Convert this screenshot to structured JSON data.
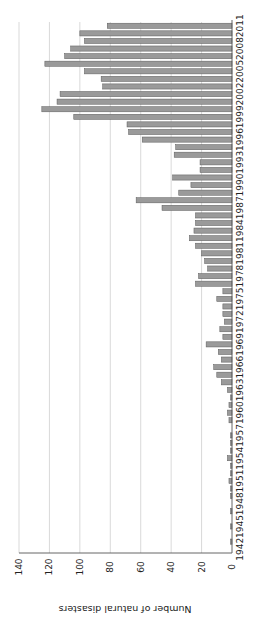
{
  "chart_data": {
    "type": "bar",
    "orientation": "rotated-90-clockwise (vertical bars rendered sideways)",
    "title": "",
    "xlabel": "",
    "ylabel": "Number of natural disasters",
    "ylim": [
      0,
      140
    ],
    "yticks": [
      0,
      20,
      40,
      60,
      80,
      100,
      120,
      140
    ],
    "grid": true,
    "legend": null,
    "xtick_labels": [
      "1942",
      "1945",
      "1948",
      "1951",
      "1954",
      "1957",
      "1960",
      "1963",
      "1966",
      "1969",
      "1972",
      "1975",
      "1978",
      "1981",
      "1984",
      "1987",
      "1990",
      "1993",
      "1996",
      "1999",
      "2002",
      "2005",
      "2008",
      "2011"
    ],
    "categories": [
      1942,
      1943,
      1944,
      1945,
      1946,
      1947,
      1948,
      1949,
      1950,
      1951,
      1952,
      1953,
      1954,
      1955,
      1956,
      1957,
      1958,
      1959,
      1960,
      1961,
      1962,
      1963,
      1964,
      1965,
      1966,
      1967,
      1968,
      1969,
      1970,
      1971,
      1972,
      1973,
      1974,
      1975,
      1976,
      1977,
      1978,
      1979,
      1980,
      1981,
      1982,
      1983,
      1984,
      1985,
      1986,
      1987,
      1988,
      1989,
      1990,
      1991,
      1992,
      1993,
      1994,
      1995,
      1996,
      1997,
      1998,
      1999,
      2000,
      2001,
      2002,
      2003,
      2004,
      2005,
      2006,
      2007,
      2008,
      2009,
      2010,
      2011
    ],
    "values": [
      0,
      1,
      0,
      1,
      0,
      1,
      0,
      1,
      1,
      2,
      1,
      1,
      3,
      1,
      1,
      1,
      0,
      2,
      3,
      2,
      1,
      3,
      7,
      10,
      12,
      7,
      9,
      17,
      6,
      8,
      5,
      6,
      6,
      10,
      6,
      24,
      22,
      16,
      18,
      20,
      24,
      28,
      25,
      24,
      24,
      46,
      63,
      35,
      27,
      39,
      21,
      21,
      38,
      37,
      59,
      68,
      69,
      104,
      125,
      115,
      113,
      85,
      86,
      97,
      123,
      110,
      106,
      97,
      100,
      82
    ]
  },
  "colors": {
    "bar_fill": "#9a9a9a",
    "bar_stroke": "#5a5a5a",
    "grid": "#cfcfcf",
    "axis": "#555555"
  }
}
